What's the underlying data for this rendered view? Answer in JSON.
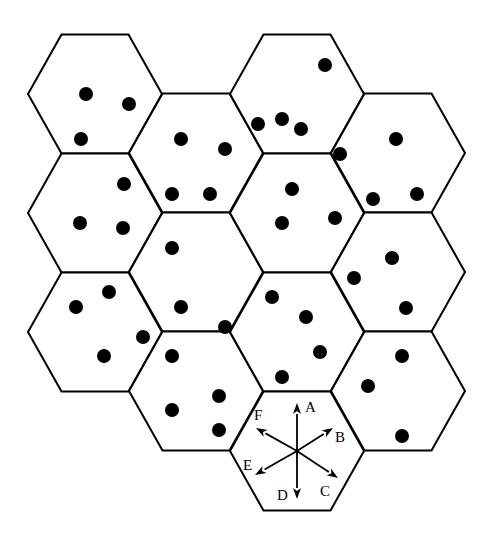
{
  "diagram": {
    "type": "hexagonal-grid",
    "hex": {
      "half_width": 67,
      "half_height": 59.5
    },
    "colors": {
      "line": "#000000",
      "dot": "#000000",
      "background": "#ffffff"
    },
    "cells": [
      {
        "id": "c0r0",
        "cx": 95,
        "cy": 94,
        "dots": [
          [
            86,
            94
          ],
          [
            129,
            104
          ],
          [
            81,
            139
          ]
        ]
      },
      {
        "id": "c0r1",
        "cx": 95,
        "cy": 213,
        "dots": [
          [
            124,
            184
          ],
          [
            80,
            223
          ],
          [
            123,
            228
          ]
        ]
      },
      {
        "id": "c0r2",
        "cx": 95,
        "cy": 332,
        "dots": [
          [
            109,
            292
          ],
          [
            76,
            307
          ],
          [
            143,
            337
          ],
          [
            104,
            356
          ]
        ]
      },
      {
        "id": "c1r0",
        "cx": 196,
        "cy": 153,
        "dots": [
          [
            181,
            139
          ],
          [
            225,
            149
          ],
          [
            172,
            194
          ],
          [
            210,
            194
          ]
        ]
      },
      {
        "id": "c1r1",
        "cx": 196,
        "cy": 272,
        "dots": [
          [
            172,
            248
          ],
          [
            181,
            307
          ],
          [
            225,
            327
          ]
        ]
      },
      {
        "id": "c1r2",
        "cx": 196,
        "cy": 391,
        "dots": [
          [
            172,
            356
          ],
          [
            172,
            410
          ],
          [
            219,
            396
          ],
          [
            219,
            430
          ]
        ]
      },
      {
        "id": "c2r0",
        "cx": 297,
        "cy": 94,
        "dots": [
          [
            325,
            65
          ],
          [
            258,
            124
          ],
          [
            282,
            119
          ],
          [
            301,
            129
          ]
        ]
      },
      {
        "id": "c2r1",
        "cx": 297,
        "cy": 213,
        "dots": [
          [
            292,
            189
          ],
          [
            282,
            223
          ],
          [
            335,
            218
          ]
        ]
      },
      {
        "id": "c2r2",
        "cx": 297,
        "cy": 332,
        "dots": [
          [
            272,
            297
          ],
          [
            306,
            317
          ],
          [
            320,
            352
          ],
          [
            282,
            377
          ]
        ]
      },
      {
        "id": "c2r3",
        "cx": 297,
        "cy": 451,
        "dots": [],
        "has_direction_arrows": true
      },
      {
        "id": "c3r0",
        "cx": 398,
        "cy": 153,
        "dots": [
          [
            396,
            139
          ],
          [
            373,
            199
          ],
          [
            417,
            194
          ],
          [
            340,
            154
          ]
        ]
      },
      {
        "id": "c3r1",
        "cx": 398,
        "cy": 272,
        "dots": [
          [
            392,
            258
          ],
          [
            354,
            278
          ],
          [
            406,
            308
          ]
        ]
      },
      {
        "id": "c3r2",
        "cx": 398,
        "cy": 391,
        "dots": [
          [
            402,
            356
          ],
          [
            368,
            386
          ],
          [
            402,
            436
          ]
        ]
      }
    ],
    "dot_radius": 7,
    "arrows": {
      "origin": [
        297,
        451
      ],
      "directions": [
        {
          "label": "A",
          "tip": [
            297,
            403
          ],
          "label_pos": [
            305,
            412
          ]
        },
        {
          "label": "B",
          "tip": [
            333,
            428
          ],
          "label_pos": [
            335,
            442
          ]
        },
        {
          "label": "C",
          "tip": [
            338,
            478
          ],
          "label_pos": [
            320,
            496
          ]
        },
        {
          "label": "D",
          "tip": [
            297,
            499
          ],
          "label_pos": [
            277,
            500
          ]
        },
        {
          "label": "E",
          "tip": [
            255,
            475
          ],
          "label_pos": [
            243,
            470
          ]
        },
        {
          "label": "F",
          "tip": [
            256,
            428
          ],
          "label_pos": [
            254,
            420
          ]
        }
      ]
    }
  }
}
